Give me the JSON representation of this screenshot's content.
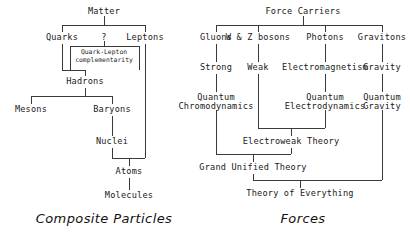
{
  "diagram": {
    "ink_color": "#1a1a1a",
    "line_color": "#3a3a3a",
    "background": "#ffffff"
  },
  "left_tree": {
    "caption": "Composite Particles",
    "nodes": {
      "matter": "Matter",
      "quarks": "Quarks",
      "question": "?",
      "leptons": "Leptons",
      "quark_lepton_line1": "Quark-Lepton",
      "quark_lepton_line2": "complementarity",
      "hadrons": "Hadrons",
      "mesons": "Mesons",
      "baryons": "Baryons",
      "nuclei": "Nuclei",
      "atoms": "Atoms",
      "molecules": "Molecules"
    }
  },
  "right_tree": {
    "caption": "Forces",
    "nodes": {
      "force_carriers": "Force Carriers",
      "gluons": "Gluons",
      "wz_bosons": "W & Z bosons",
      "photons": "Photons",
      "gravitons": "Gravitons",
      "strong": "Strong",
      "weak": "Weak",
      "electromagnetism": "Electromagnetism",
      "gravity": "Gravity",
      "qcd_line1": "Quantum",
      "qcd_line2": "Chromodynamics",
      "qed_line1": "Quantum",
      "qed_line2": "Electrodynamics",
      "qg_line1": "Quantum",
      "qg_line2": "Gravity",
      "electroweak": "Electroweak Theory",
      "gut": "Grand Unified Theory",
      "toe": "Theory of Everything"
    }
  }
}
